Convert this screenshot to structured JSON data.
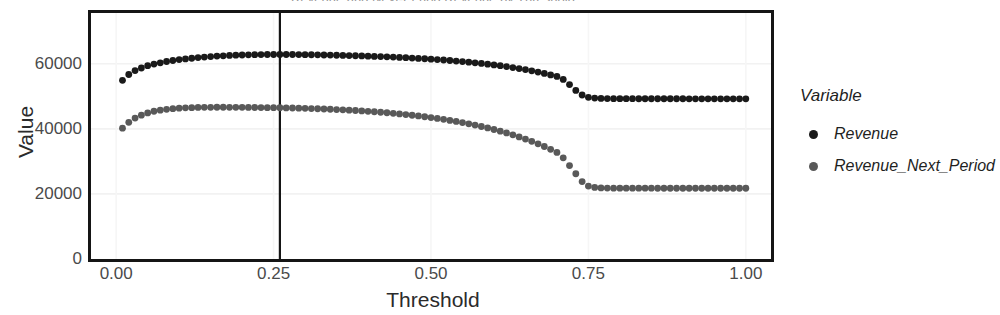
{
  "figure": {
    "clipped_title": "Revenue and Next-Period Revenue by Threshold"
  },
  "legend": {
    "title": "Variable",
    "entries": [
      {
        "label": "Revenue",
        "color": "#1a1a1a",
        "key": "legend-dot"
      },
      {
        "label": "Revenue_Next_Period",
        "color": "#595959",
        "key": "legend-dot"
      }
    ]
  },
  "axes": {
    "x_ticks": [
      "0.00",
      "0.25",
      "0.50",
      "0.75",
      "1.00"
    ],
    "y_ticks": [
      "0",
      "20000",
      "40000",
      "60000"
    ]
  },
  "chart_data": {
    "type": "scatter",
    "title": "Revenue and Next-Period Revenue by Threshold",
    "xlabel": "Threshold",
    "ylabel": "Value",
    "xlim": [
      -0.04,
      1.04
    ],
    "ylim": [
      0,
      75600
    ],
    "x_ticks": [
      0.0,
      0.25,
      0.5,
      0.75,
      1.0
    ],
    "y_ticks": [
      0,
      20000,
      40000,
      60000
    ],
    "grid": true,
    "legend_position": "right",
    "legend_title": "Variable",
    "annotations": [
      {
        "type": "vline",
        "x": 0.26,
        "color": "#151515",
        "label": ""
      }
    ],
    "x": [
      0.01,
      0.02,
      0.03,
      0.04,
      0.05,
      0.06,
      0.07,
      0.08,
      0.09,
      0.1,
      0.11,
      0.12,
      0.13,
      0.14,
      0.15,
      0.16,
      0.17,
      0.18,
      0.19,
      0.2,
      0.21,
      0.22,
      0.23,
      0.24,
      0.25,
      0.26,
      0.27,
      0.28,
      0.29,
      0.3,
      0.31,
      0.32,
      0.33,
      0.34,
      0.35,
      0.36,
      0.37,
      0.38,
      0.39,
      0.4,
      0.41,
      0.42,
      0.43,
      0.44,
      0.45,
      0.46,
      0.47,
      0.48,
      0.49,
      0.5,
      0.51,
      0.52,
      0.53,
      0.54,
      0.55,
      0.56,
      0.57,
      0.58,
      0.59,
      0.6,
      0.61,
      0.62,
      0.63,
      0.64,
      0.65,
      0.66,
      0.67,
      0.68,
      0.69,
      0.7,
      0.71,
      0.72,
      0.73,
      0.74,
      0.75,
      0.76,
      0.77,
      0.78,
      0.79,
      0.8,
      0.81,
      0.82,
      0.83,
      0.84,
      0.85,
      0.86,
      0.87,
      0.88,
      0.89,
      0.9,
      0.91,
      0.92,
      0.93,
      0.94,
      0.95,
      0.96,
      0.97,
      0.98,
      0.99,
      1.0
    ],
    "series": [
      {
        "name": "Revenue",
        "color": "#1a1a1a",
        "values": [
          54900,
          56700,
          57900,
          58700,
          59400,
          59900,
          60300,
          60700,
          61000,
          61300,
          61500,
          61700,
          61900,
          62050,
          62200,
          62350,
          62450,
          62550,
          62650,
          62700,
          62750,
          62800,
          62820,
          62840,
          62850,
          62860,
          62850,
          62840,
          62820,
          62800,
          62770,
          62740,
          62700,
          62660,
          62620,
          62570,
          62520,
          62460,
          62400,
          62340,
          62270,
          62200,
          62120,
          62040,
          61950,
          61860,
          61760,
          61650,
          61540,
          61420,
          61290,
          61150,
          61000,
          60840,
          60670,
          60490,
          60300,
          60100,
          59880,
          59650,
          59400,
          59130,
          58840,
          58530,
          58200,
          57840,
          57450,
          57030,
          56580,
          56100,
          55200,
          53600,
          51800,
          50400,
          49700,
          49450,
          49350,
          49300,
          49280,
          49270,
          49260,
          49260,
          49255,
          49250,
          49250,
          49245,
          49245,
          49240,
          49240,
          49240,
          49235,
          49235,
          49230,
          49230,
          49230,
          49225,
          49225,
          49220,
          49220,
          49220
        ]
      },
      {
        "name": "Revenue_Next_Period",
        "color": "#595959",
        "values": [
          40200,
          42000,
          43300,
          44200,
          44900,
          45400,
          45750,
          46000,
          46200,
          46350,
          46450,
          46520,
          46570,
          46600,
          46620,
          46630,
          46630,
          46625,
          46615,
          46600,
          46580,
          46560,
          46540,
          46520,
          46500,
          46480,
          46440,
          46400,
          46350,
          46300,
          46240,
          46170,
          46100,
          46020,
          45930,
          45840,
          45740,
          45630,
          45510,
          45390,
          45250,
          45100,
          44940,
          44770,
          44590,
          44390,
          44180,
          43960,
          43720,
          43470,
          43200,
          42910,
          42600,
          42270,
          41920,
          41550,
          41150,
          40720,
          40270,
          39790,
          39280,
          38730,
          38150,
          37530,
          36870,
          36160,
          35400,
          34580,
          33700,
          32750,
          31100,
          28700,
          26200,
          23800,
          22400,
          22000,
          21850,
          21800,
          21780,
          21770,
          21765,
          21760,
          21760,
          21755,
          21755,
          21750,
          21750,
          21748,
          21746,
          21745,
          21744,
          21743,
          21742,
          21741,
          21740,
          21740,
          21739,
          21738,
          21738,
          21737
        ]
      }
    ]
  }
}
